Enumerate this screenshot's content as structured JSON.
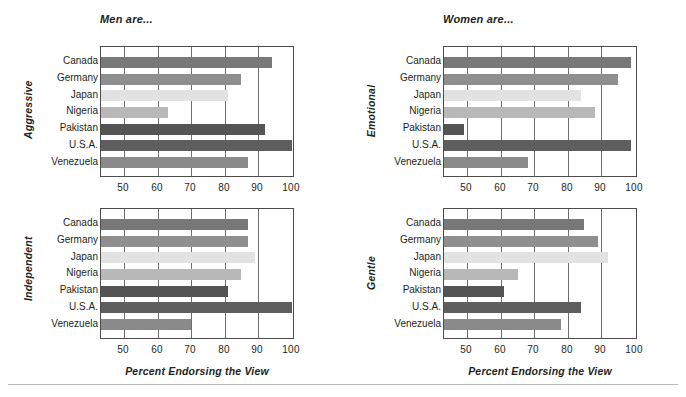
{
  "figure": {
    "width": 686,
    "height": 397,
    "background": "#ffffff",
    "axis_color": "#4c4c4c",
    "grid_color": "#6e6e6e",
    "text_color": "#231f20",
    "rule_color": "#b9b9b9"
  },
  "titles": {
    "men": "Men are...",
    "women": "Women are..."
  },
  "xlabel": "Percent Endorsing the View",
  "categories": [
    "Canada",
    "Germany",
    "Japan",
    "Nigeria",
    "Pakistan",
    "U.S.A.",
    "Venezuela"
  ],
  "tick_labels": [
    "50",
    "60",
    "70",
    "80",
    "90",
    "100"
  ],
  "tick_values": [
    50,
    60,
    70,
    80,
    90,
    100
  ],
  "bar_colors": {
    "Canada": "#787878",
    "Germany": "#8f8f8f",
    "Japan": "#e2e2e2",
    "Nigeria": "#b8b8b8",
    "Pakistan": "#545454",
    "U.S.A.": "#5e5e5e",
    "Venezuela": "#8a8a8a"
  },
  "panels": [
    {
      "key": "aggressive",
      "super_title": "Men are...",
      "group_label": "Aggressive",
      "show_super_title": true,
      "show_xlabel": false,
      "values": [
        94,
        85,
        81,
        63,
        92,
        100,
        87
      ]
    },
    {
      "key": "emotional",
      "super_title": "Women are...",
      "group_label": "Emotional",
      "show_super_title": true,
      "show_xlabel": false,
      "values": [
        99,
        95,
        84,
        88,
        49,
        99,
        68
      ]
    },
    {
      "key": "independent",
      "super_title": "",
      "group_label": "Independent",
      "show_super_title": false,
      "show_xlabel": true,
      "values": [
        87,
        87,
        89,
        85,
        81,
        100,
        70
      ]
    },
    {
      "key": "gentle",
      "super_title": "",
      "group_label": "Gentle",
      "show_super_title": false,
      "show_xlabel": true,
      "values": [
        85,
        89,
        92,
        65,
        61,
        84,
        78
      ]
    }
  ],
  "chart_data": {
    "type": "bar",
    "orientation": "horizontal",
    "xlabel": "Percent Endorsing the View",
    "ylabel": "",
    "xlim": [
      43,
      101
    ],
    "xticks": [
      50,
      60,
      70,
      80,
      90,
      100
    ],
    "grid": true,
    "legend": "none",
    "categories": [
      "Canada",
      "Germany",
      "Japan",
      "Nigeria",
      "Pakistan",
      "U.S.A.",
      "Venezuela"
    ],
    "panels": [
      {
        "panel_title": "Men are...",
        "trait": "Aggressive",
        "position": "top-left",
        "series": [
          {
            "name": "Aggressive",
            "values": [
              94,
              85,
              81,
              63,
              92,
              100,
              87
            ]
          }
        ]
      },
      {
        "panel_title": "Women are...",
        "trait": "Emotional",
        "position": "top-right",
        "series": [
          {
            "name": "Emotional",
            "values": [
              99,
              95,
              84,
              88,
              49,
              99,
              68
            ]
          }
        ]
      },
      {
        "panel_title": "Men are...",
        "trait": "Independent",
        "position": "bottom-left",
        "series": [
          {
            "name": "Independent",
            "values": [
              87,
              87,
              89,
              85,
              81,
              100,
              70
            ]
          }
        ]
      },
      {
        "panel_title": "Women are...",
        "trait": "Gentle",
        "position": "bottom-right",
        "series": [
          {
            "name": "Gentle",
            "values": [
              85,
              89,
              92,
              65,
              61,
              84,
              78
            ]
          }
        ]
      }
    ]
  }
}
